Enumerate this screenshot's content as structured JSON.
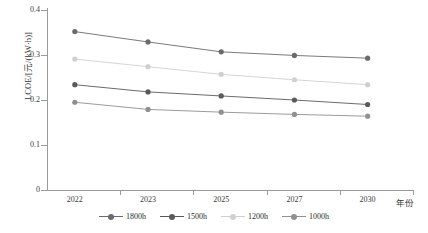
{
  "chart_data": {
    "type": "line",
    "title": "",
    "xlabel": "年份",
    "ylabel": "LCOE/[元/(kW·h)]",
    "categories": [
      "2022",
      "2023",
      "2025",
      "2027",
      "2030"
    ],
    "ylim": [
      0,
      0.4
    ],
    "yticks": [
      "0",
      "0.1",
      "0.2",
      "0.3",
      "0.4"
    ],
    "ytick_values": [
      0,
      0.1,
      0.2,
      0.3,
      0.4
    ],
    "grid": false,
    "legend_position": "bottom",
    "series": [
      {
        "name": "1800h",
        "values": [
          0.352,
          0.329,
          0.307,
          0.299,
          0.293
        ],
        "color": "#6b6b6b"
      },
      {
        "name": "1500h",
        "values": [
          0.234,
          0.218,
          0.209,
          0.2,
          0.19
        ],
        "color": "#5a5a5a"
      },
      {
        "name": "1200h",
        "values": [
          0.291,
          0.274,
          0.257,
          0.245,
          0.234
        ],
        "color": "#d0d0d0"
      },
      {
        "name": "1000h",
        "values": [
          0.195,
          0.179,
          0.173,
          0.168,
          0.164
        ],
        "color": "#909090"
      }
    ]
  },
  "legend": {
    "items": [
      {
        "label": "1800h"
      },
      {
        "label": "1500h"
      },
      {
        "label": "1200h"
      },
      {
        "label": "1000h"
      }
    ]
  },
  "colors": {
    "axis": "#9a9a9a",
    "text": "#2b2b2b",
    "background": "#ffffff"
  }
}
